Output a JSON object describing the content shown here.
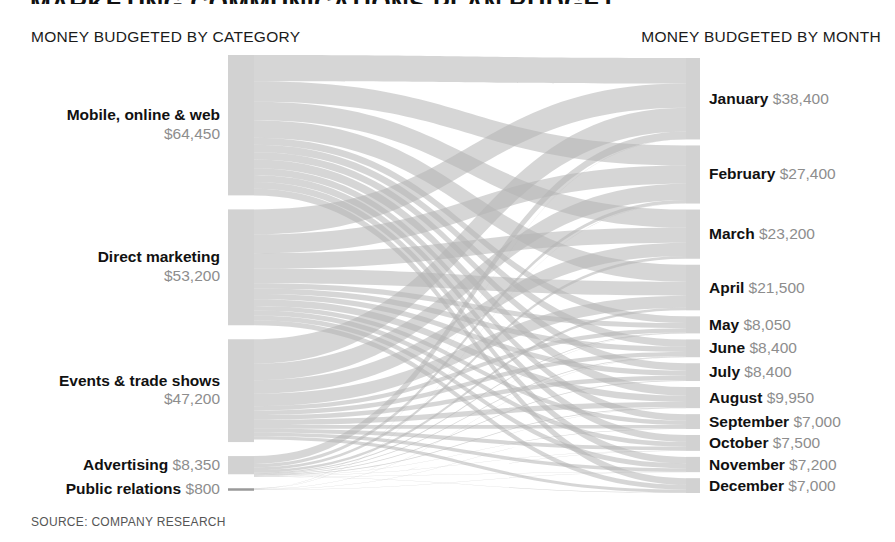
{
  "title": "MARKETING COMMUNICATIONS PLAN BUDGET",
  "headers": {
    "left": "MONEY BUDGETED BY CATEGORY",
    "right": "MONEY BUDGETED BY MONTH"
  },
  "source": "SOURCE: COMPANY RESEARCH",
  "colors": {
    "node": "#d2d2d2",
    "node_dark": "#9a9a9a",
    "link": "#b4b4b4",
    "text": "#111111",
    "value_text": "#8d8d8d",
    "background": "#ffffff"
  },
  "chart_data": {
    "type": "sankey",
    "title": "MARKETING COMMUNICATIONS PLAN BUDGET",
    "units": "USD",
    "total": 174000,
    "left_axis_label": "MONEY BUDGETED BY CATEGORY",
    "right_axis_label": "MONEY BUDGETED BY MONTH",
    "sources": [
      {
        "name": "Mobile, online & web",
        "value": 64450,
        "value_label": "$64,450",
        "two_line": true
      },
      {
        "name": "Direct marketing",
        "value": 53200,
        "value_label": "$53,200",
        "two_line": true
      },
      {
        "name": "Events & trade shows",
        "value": 47200,
        "value_label": "$47,200",
        "two_line": true
      },
      {
        "name": "Advertising",
        "value": 8350,
        "value_label": "$8,350",
        "two_line": false
      },
      {
        "name": "Public relations",
        "value": 800,
        "value_label": "$800",
        "two_line": false
      }
    ],
    "targets": [
      {
        "name": "January",
        "value": 38400,
        "value_label": "$38,400"
      },
      {
        "name": "February",
        "value": 27400,
        "value_label": "$27,400"
      },
      {
        "name": "March",
        "value": 23200,
        "value_label": "$23,200"
      },
      {
        "name": "April",
        "value": 21500,
        "value_label": "$21,500"
      },
      {
        "name": "May",
        "value": 8050,
        "value_label": "$8,050"
      },
      {
        "name": "June",
        "value": 8400,
        "value_label": "$8,400"
      },
      {
        "name": "July",
        "value": 8400,
        "value_label": "$8,400"
      },
      {
        "name": "August",
        "value": 9950,
        "value_label": "$9,950"
      },
      {
        "name": "September",
        "value": 7000,
        "value_label": "$7,000"
      },
      {
        "name": "October",
        "value": 7500,
        "value_label": "$7,500"
      },
      {
        "name": "November",
        "value": 7200,
        "value_label": "$7,200"
      },
      {
        "name": "December",
        "value": 7000,
        "value_label": "$7,000"
      }
    ],
    "links": [
      {
        "source": "Mobile, online & web",
        "target": "January",
        "value": 12000
      },
      {
        "source": "Mobile, online & web",
        "target": "February",
        "value": 9500
      },
      {
        "source": "Mobile, online & web",
        "target": "March",
        "value": 8500
      },
      {
        "source": "Mobile, online & web",
        "target": "April",
        "value": 8000
      },
      {
        "source": "Mobile, online & web",
        "target": "May",
        "value": 3200
      },
      {
        "source": "Mobile, online & web",
        "target": "June",
        "value": 3400
      },
      {
        "source": "Mobile, online & web",
        "target": "July",
        "value": 3400
      },
      {
        "source": "Mobile, online & web",
        "target": "August",
        "value": 4050
      },
      {
        "source": "Mobile, online & web",
        "target": "September",
        "value": 3000
      },
      {
        "source": "Mobile, online & web",
        "target": "October",
        "value": 3200
      },
      {
        "source": "Mobile, online & web",
        "target": "November",
        "value": 3100
      },
      {
        "source": "Mobile, online & web",
        "target": "December",
        "value": 3100
      },
      {
        "source": "Direct marketing",
        "target": "January",
        "value": 11500
      },
      {
        "source": "Direct marketing",
        "target": "February",
        "value": 8600
      },
      {
        "source": "Direct marketing",
        "target": "March",
        "value": 7200
      },
      {
        "source": "Direct marketing",
        "target": "April",
        "value": 6600
      },
      {
        "source": "Direct marketing",
        "target": "May",
        "value": 2400
      },
      {
        "source": "Direct marketing",
        "target": "June",
        "value": 2500
      },
      {
        "source": "Direct marketing",
        "target": "July",
        "value": 2500
      },
      {
        "source": "Direct marketing",
        "target": "August",
        "value": 3000
      },
      {
        "source": "Direct marketing",
        "target": "September",
        "value": 2100
      },
      {
        "source": "Direct marketing",
        "target": "October",
        "value": 2300
      },
      {
        "source": "Direct marketing",
        "target": "November",
        "value": 2250
      },
      {
        "source": "Direct marketing",
        "target": "December",
        "value": 2250
      },
      {
        "source": "Events & trade shows",
        "target": "January",
        "value": 11200
      },
      {
        "source": "Events & trade shows",
        "target": "February",
        "value": 7600
      },
      {
        "source": "Events & trade shows",
        "target": "March",
        "value": 6200
      },
      {
        "source": "Events & trade shows",
        "target": "April",
        "value": 5700
      },
      {
        "source": "Events & trade shows",
        "target": "May",
        "value": 2000
      },
      {
        "source": "Events & trade shows",
        "target": "June",
        "value": 2100
      },
      {
        "source": "Events & trade shows",
        "target": "July",
        "value": 2100
      },
      {
        "source": "Events & trade shows",
        "target": "August",
        "value": 2500
      },
      {
        "source": "Events & trade shows",
        "target": "September",
        "value": 1700
      },
      {
        "source": "Events & trade shows",
        "target": "October",
        "value": 1800
      },
      {
        "source": "Events & trade shows",
        "target": "November",
        "value": 1650
      },
      {
        "source": "Events & trade shows",
        "target": "December",
        "value": 1450
      },
      {
        "source": "Advertising",
        "target": "January",
        "value": 3600
      },
      {
        "source": "Advertising",
        "target": "February",
        "value": 1600
      },
      {
        "source": "Advertising",
        "target": "March",
        "value": 1250
      },
      {
        "source": "Advertising",
        "target": "April",
        "value": 1150
      },
      {
        "source": "Advertising",
        "target": "May",
        "value": 400
      },
      {
        "source": "Advertising",
        "target": "June",
        "value": 350
      },
      {
        "source": "Advertising",
        "target": "July",
        "value": 350
      },
      {
        "source": "Advertising",
        "target": "August",
        "value": 350
      },
      {
        "source": "Advertising",
        "target": "September",
        "value": 150
      },
      {
        "source": "Advertising",
        "target": "October",
        "value": 150
      },
      {
        "source": "Advertising",
        "target": "November",
        "value": 150
      },
      {
        "source": "Advertising",
        "target": "December",
        "value": 150
      },
      {
        "source": "Public relations",
        "target": "January",
        "value": 100
      },
      {
        "source": "Public relations",
        "target": "February",
        "value": 100
      },
      {
        "source": "Public relations",
        "target": "March",
        "value": 50
      },
      {
        "source": "Public relations",
        "target": "April",
        "value": 50
      },
      {
        "source": "Public relations",
        "target": "May",
        "value": 50
      },
      {
        "source": "Public relations",
        "target": "June",
        "value": 50
      },
      {
        "source": "Public relations",
        "target": "July",
        "value": 50
      },
      {
        "source": "Public relations",
        "target": "August",
        "value": 50
      },
      {
        "source": "Public relations",
        "target": "September",
        "value": 50
      },
      {
        "source": "Public relations",
        "target": "October",
        "value": 50
      },
      {
        "source": "Public relations",
        "target": "November",
        "value": 150
      },
      {
        "source": "Public relations",
        "target": "December",
        "value": 50
      }
    ]
  },
  "layout": {
    "left_node_x": 228,
    "left_node_w": 26,
    "right_node_x": 686,
    "right_node_w": 14,
    "top": 55,
    "bottom": 490,
    "source_gap": 14,
    "target_gap": 6
  }
}
